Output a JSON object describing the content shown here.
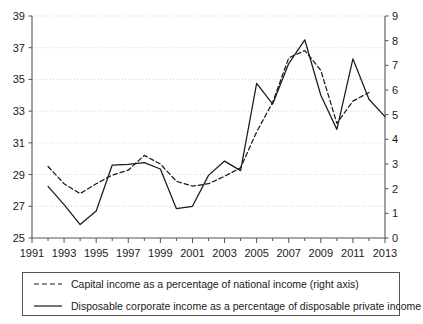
{
  "chart_data": {
    "type": "line",
    "title": "",
    "subtitle": "",
    "xlabel": "",
    "ylabel": "",
    "x": [
      1991,
      1992,
      1993,
      1994,
      1995,
      1996,
      1997,
      1998,
      1999,
      2000,
      2001,
      2002,
      2003,
      2004,
      2005,
      2006,
      2007,
      2008,
      2009,
      2010,
      2011,
      2012,
      2013
    ],
    "xlim": [
      1991,
      2013
    ],
    "xticks": [
      1991,
      1993,
      1995,
      1997,
      1999,
      2001,
      2003,
      2005,
      2007,
      2009,
      2011,
      2013
    ],
    "xtick_labels": [
      "1991",
      "1993",
      "1995",
      "1997",
      "1999",
      "2001",
      "2003",
      "2005",
      "2007",
      "2009",
      "2011",
      "2013"
    ],
    "minor_xticks": [
      1992,
      1994,
      1996,
      1998,
      2000,
      2002,
      2004,
      2006,
      2008,
      2010,
      2012
    ],
    "grid": true,
    "grid_axis": "y",
    "legend_position": "bottom",
    "axes": [
      {
        "id": "left",
        "side": "left",
        "ylim": [
          25,
          39
        ],
        "yticks": [
          25,
          27,
          29,
          31,
          33,
          35,
          37,
          39
        ],
        "ytick_labels": [
          "25",
          "27",
          "29",
          "31",
          "33",
          "35",
          "37",
          "39"
        ]
      },
      {
        "id": "right",
        "side": "right",
        "ylim": [
          0,
          9
        ],
        "yticks": [
          0,
          1,
          2,
          3,
          4,
          5,
          6,
          7,
          8,
          9
        ],
        "ytick_labels": [
          "0",
          "1",
          "2",
          "3",
          "4",
          "5",
          "6",
          "7",
          "8",
          "9"
        ]
      }
    ],
    "series": [
      {
        "name": "Capital income as a percentage of national income (right axis)",
        "axis": "right",
        "style": "dashed",
        "color": "#1a1a1a",
        "x": [
          1992,
          1993,
          1994,
          1995,
          1996,
          1997,
          1998,
          1999,
          2000,
          2001,
          2002,
          2003,
          2004,
          2005,
          2006,
          2007,
          2008,
          2009,
          2010,
          2011,
          2012
        ],
        "values": [
          2.9,
          2.2,
          1.8,
          2.2,
          2.55,
          2.75,
          3.35,
          3.0,
          2.3,
          2.1,
          2.2,
          2.5,
          2.85,
          4.3,
          5.5,
          7.3,
          7.6,
          6.8,
          4.65,
          5.55,
          5.9
        ]
      },
      {
        "name": "Disposable corporate income as a percentage of disposable private income",
        "axis": "left",
        "style": "solid",
        "color": "#1a1a1a",
        "x": [
          1992,
          1993,
          1994,
          1995,
          1996,
          1997,
          1998,
          1999,
          2000,
          2001,
          2002,
          2003,
          2004,
          2005,
          2006,
          2007,
          2008,
          2009,
          2010,
          2011,
          2012,
          2013
        ],
        "values": [
          28.25,
          27.1,
          25.85,
          26.7,
          29.6,
          29.65,
          29.75,
          29.35,
          26.85,
          27.0,
          28.95,
          29.85,
          29.25,
          34.75,
          33.45,
          36.0,
          37.5,
          34.0,
          31.85,
          36.3,
          33.75,
          32.65
        ]
      }
    ]
  },
  "legend": {
    "items": [
      {
        "label": "Capital income as a percentage of national income (right axis)",
        "style": "dashed"
      },
      {
        "label": "Disposable corporate income as a percentage of disposable private income",
        "style": "solid"
      }
    ]
  }
}
